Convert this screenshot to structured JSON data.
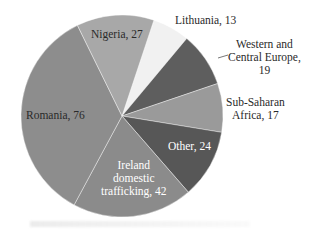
{
  "chart_data": {
    "type": "pie",
    "title": "",
    "start_angle_deg_from_top_clockwise": 18.4,
    "categories": [
      "Lithuania",
      "Western and Central Europe",
      "Sub-Saharan Africa",
      "Other",
      "Ireland domestic trafficking",
      "Romania",
      "Nigeria"
    ],
    "values": [
      13,
      19,
      17,
      24,
      42,
      76,
      27
    ],
    "colors": [
      "#f1f1f1",
      "#5e5e5e",
      "#9a9a9a",
      "#575757",
      "#8b8b8b",
      "#8d8d8d",
      "#a8a8a8"
    ],
    "data_labels": true,
    "legend": "none"
  },
  "labels": {
    "lithuania": "Lithuania, 13",
    "wce_1": "Western and",
    "wce_2": "Central Europe,",
    "wce_3": "19",
    "ssa_1": "Sub-Saharan",
    "ssa_2": "Africa, 17",
    "other": "Other, 24",
    "ireland_1": "Ireland",
    "ireland_2": "domestic",
    "ireland_3": "trafficking, 42",
    "romania": "Romania, 76",
    "nigeria": "Nigeria, 27"
  }
}
